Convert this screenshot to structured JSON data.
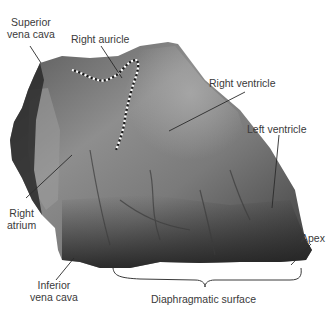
{
  "figure": {
    "colors": {
      "background": "#ffffff",
      "label_text": "#3a3a3a",
      "leader_line": "#2a2a2a",
      "auricle_outline": "#ffffff",
      "tissue_light": "#9a9a9a",
      "tissue_mid": "#6e6e6e",
      "tissue_dark": "#2e2e2e"
    }
  },
  "labels": {
    "superior_vena_cava": "Superior\nvena cava",
    "superior_vena_cava_line1": "Superior",
    "superior_vena_cava_line2": "vena cava",
    "right_auricle": "Right auricle",
    "right_ventricle": "Right ventricle",
    "left_ventricle": "Left ventricle",
    "right_atrium_line1": "Right",
    "right_atrium_line2": "atrium",
    "inferior_vena_cava_line1": "Inferior",
    "inferior_vena_cava_line2": "vena cava",
    "apex": "Apex",
    "diaphragmatic_surface": "Diaphragmatic surface"
  }
}
